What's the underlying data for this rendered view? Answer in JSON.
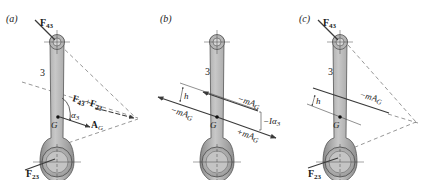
{
  "colors": {
    "link_body": "#9e9e9e",
    "link_highlight": "#c9c9c9",
    "link_outline": "#555555",
    "arrow": "#3a3a3a",
    "dashed": "#6a6a6a",
    "text": "#1a1a1a"
  },
  "panels": [
    {
      "id": "a",
      "tag": "(a)",
      "link_label": "3",
      "labels": {
        "f43": "F",
        "f43_sub": "43",
        "f23": "F",
        "f23_sub": "23",
        "sum_f1": "F",
        "sum_f1_sub": "43",
        "sum_plus": "+",
        "sum_f2": "F",
        "sum_f2_sub": "23",
        "g": "G",
        "alpha": "α",
        "alpha_sub": "3",
        "ag": "A",
        "ag_sub": "G"
      }
    },
    {
      "id": "b",
      "tag": "(b)",
      "link_label": "3",
      "labels": {
        "h": "h",
        "neg_mag_top": "−mA",
        "neg_mag_top_sub": "G",
        "neg_mag_left": "−mA",
        "neg_mag_left_sub": "G",
        "pos_mag": "+mA",
        "pos_mag_sub": "G",
        "couple": "−Iα",
        "couple_sub": "3",
        "g": "G"
      }
    },
    {
      "id": "c",
      "tag": "(c)",
      "link_label": "3",
      "labels": {
        "f43": "F",
        "f43_sub": "43",
        "f23": "F",
        "f23_sub": "23",
        "h": "h",
        "neg_mag": "−mA",
        "neg_mag_sub": "G",
        "g": "G"
      }
    }
  ]
}
